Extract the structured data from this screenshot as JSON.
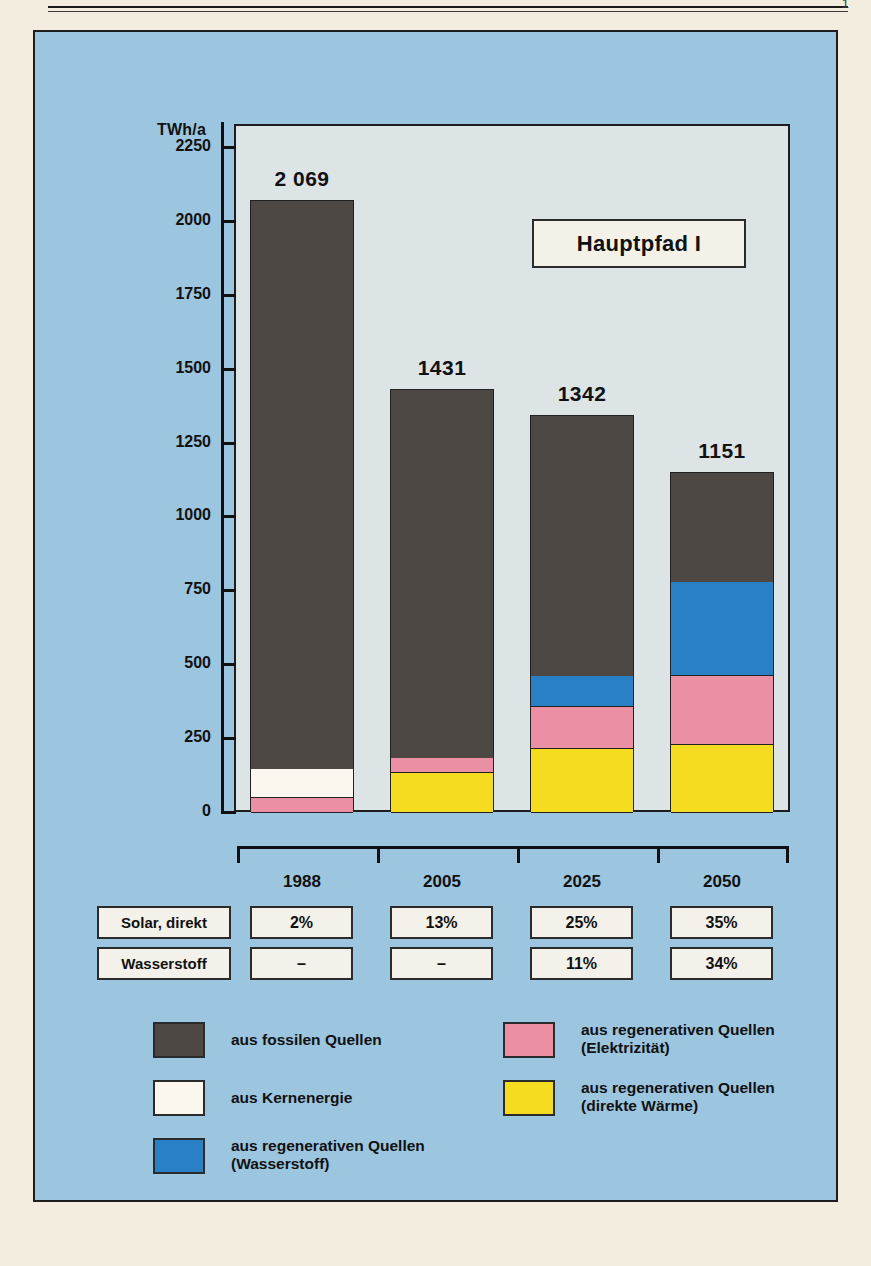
{
  "page": {
    "folio": "1"
  },
  "chart_data": {
    "type": "bar",
    "subtype": "stacked",
    "title": "Hauptpfad I",
    "ylabel": "TWh/a",
    "xlabel": "",
    "ylim": [
      0,
      2250
    ],
    "yticks": [
      0,
      250,
      500,
      750,
      1000,
      1250,
      1500,
      1750,
      2000,
      2250
    ],
    "ytick_labels": [
      "0",
      "250",
      "500",
      "750",
      "1000",
      "1250",
      "1500",
      "1750",
      "2000",
      "2250"
    ],
    "categories": [
      "1988",
      "2005",
      "2025",
      "2050"
    ],
    "totals": [
      2069,
      1431,
      1342,
      1151
    ],
    "total_labels": [
      "2 069",
      "1431",
      "1342",
      "1151"
    ],
    "grid": false,
    "legend_position": "bottom",
    "series": [
      {
        "name": "aus regenerativen Quellen (direkte Wärme)",
        "key": "solar_heat",
        "color": "#f6dc21",
        "values": [
          0,
          135,
          215,
          230
        ]
      },
      {
        "name": "aus regenerativen Quellen (Elektrizität)",
        "key": "regen_elec",
        "color": "#eb8fa4",
        "values": [
          50,
          52,
          145,
          235
        ]
      },
      {
        "name": "aus Kernenergie",
        "key": "nuclear",
        "color": "#fbf7ef",
        "values": [
          100,
          0,
          0,
          0
        ]
      },
      {
        "name": "aus regenerativen Quellen (Wasserstoff)",
        "key": "hydrogen",
        "color": "#2a80c4",
        "values": [
          0,
          0,
          105,
          315
        ]
      },
      {
        "name": "aus fossilen Quellen",
        "key": "fossil",
        "color": "#4d4843",
        "values": [
          1919,
          1244,
          877,
          371
        ]
      }
    ]
  },
  "legend": {
    "items": [
      {
        "color": "#4d4843",
        "label": "aus fossilen Quellen",
        "icon": "legend-swatch-fossil"
      },
      {
        "color": "#fbf7ef",
        "label": "aus Kernenergie",
        "icon": "legend-swatch-nuclear"
      },
      {
        "color": "#2a80c4",
        "label": "aus regenerativen Quellen\n(Wasserstoff)",
        "icon": "legend-swatch-hydrogen"
      },
      {
        "color": "#eb8fa4",
        "label": "aus regenerativen Quellen\n(Elektrizität)",
        "icon": "legend-swatch-electricity"
      },
      {
        "color": "#f6dc21",
        "label": "aus regenerativen Quellen\n(direkte Wärme)",
        "icon": "legend-swatch-heat"
      }
    ]
  },
  "table": {
    "columns": [
      "1988",
      "2005",
      "2025",
      "2050"
    ],
    "rows": [
      {
        "label": "Solar, direkt",
        "values": [
          "2%",
          "13%",
          "25%",
          "35%"
        ]
      },
      {
        "label": "Wasserstoff",
        "values": [
          "–",
          "–",
          "11%",
          "34%"
        ]
      }
    ]
  },
  "colors": {
    "panel_background": "#9cc5e0",
    "plot_background": "#dce4e6",
    "paper": "#f3eddf",
    "ink": "#1a1a1a",
    "box_fill": "#f3f1e9"
  }
}
